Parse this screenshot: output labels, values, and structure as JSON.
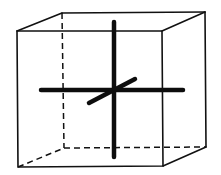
{
  "diagram": {
    "type": "cube-with-axes",
    "colors": {
      "background": "#ffffff",
      "line": "#111111",
      "axis": "#0d0d0d"
    },
    "cube": {
      "front_face": {
        "top_left": [
          17,
          31
        ],
        "top_right": [
          162,
          31
        ],
        "bottom_right": [
          163,
          166
        ],
        "bottom_left": [
          18,
          167
        ]
      },
      "back_face": {
        "top_left": [
          62,
          13
        ],
        "top_right": [
          205,
          12
        ],
        "bottom_right": [
          206,
          147
        ],
        "bottom_left": [
          64,
          148
        ]
      },
      "hidden_edges": [
        "back-left-vertical",
        "back-bottom",
        "bottom-left-depth"
      ]
    },
    "axes": [
      {
        "name": "horizontal-axis",
        "from": [
          41,
          90
        ],
        "to": [
          183,
          90
        ]
      },
      {
        "name": "vertical-axis",
        "from": [
          114,
          22
        ],
        "to": [
          114,
          157
        ]
      },
      {
        "name": "depth-axis",
        "from": [
          89,
          103
        ],
        "to": [
          135,
          79
        ]
      }
    ]
  }
}
